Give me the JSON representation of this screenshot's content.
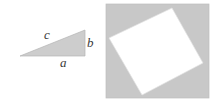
{
  "figure": {
    "title": "",
    "canvas": {
      "width": 217,
      "height": 103,
      "background": "#ffffff"
    },
    "left_panel": {
      "name": "right-triangle-diagram",
      "shape": "right triangle",
      "fill_color": "#cdcdcd",
      "stroke_color": "#b4b4b4",
      "vertices": [
        {
          "name": "left-vertex",
          "x": 20,
          "y": 56
        },
        {
          "name": "top-right-vertex",
          "x": 85,
          "y": 30
        },
        {
          "name": "bottom-right-vertex",
          "x": 85,
          "y": 56
        }
      ],
      "labels": [
        {
          "id": "c",
          "text": "c",
          "side": "hypotenuse",
          "x": 44,
          "y": 28
        },
        {
          "id": "b",
          "text": "b",
          "side": "vertical-leg",
          "x": 87,
          "y": 36
        },
        {
          "id": "a",
          "text": "a",
          "side": "horizontal-leg",
          "x": 60,
          "y": 56
        }
      ]
    },
    "right_panel": {
      "name": "tilted-square-diagram",
      "outer_square": {
        "fill_color": "#c8c8c8",
        "stroke_color": "#bdbdbd",
        "x": 106,
        "y": 4,
        "width": 103,
        "height": 94
      },
      "inner_square": {
        "fill_color": "#ffffff",
        "stroke_color": "#e2e2e2",
        "rotated": true,
        "vertices": [
          {
            "name": "top-corner",
            "x": 172,
            "y": 8
          },
          {
            "name": "right-corner",
            "x": 203,
            "y": 63
          },
          {
            "name": "bottom-corner",
            "x": 142,
            "y": 95
          },
          {
            "name": "left-corner",
            "x": 109,
            "y": 38
          }
        ]
      }
    }
  }
}
